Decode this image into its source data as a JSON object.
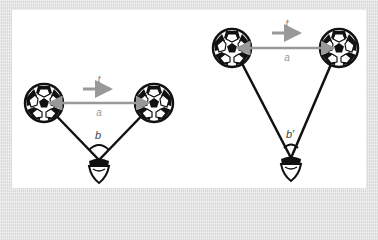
{
  "colors": {
    "background": "#e6e6e6",
    "panel": "#ffffff",
    "line": "#111111",
    "arrow": "#999999",
    "label_gray": "#888888",
    "label_dark": "#444444"
  },
  "left_scene": {
    "motion_label": "t",
    "distance_label": "a",
    "angle_label": "b"
  },
  "right_scene": {
    "motion_label": "t",
    "distance_label": "a",
    "angle_label": "b′"
  }
}
